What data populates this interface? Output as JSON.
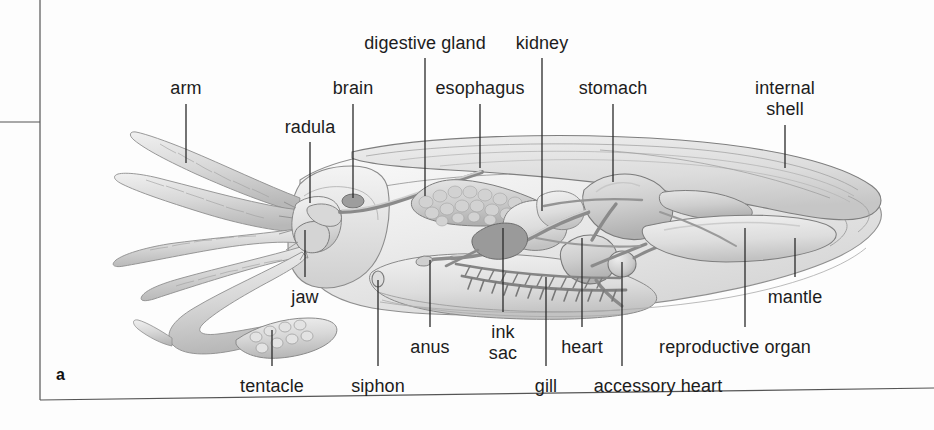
{
  "figure": {
    "panel_id": "a",
    "background_color": "#fdfdfd",
    "label_color": "#1c1c1c",
    "leader_color": "#2a2a2a"
  },
  "labels": [
    {
      "id": "arm",
      "text": "arm",
      "x": 186,
      "y": 78,
      "align": "center",
      "leader": {
        "x1": 186,
        "y1": 104,
        "x2": 186,
        "y2": 163
      }
    },
    {
      "id": "radula",
      "text": "radula",
      "x": 310,
      "y": 117,
      "align": "center",
      "leader": {
        "x1": 310,
        "y1": 142,
        "x2": 310,
        "y2": 203
      }
    },
    {
      "id": "brain",
      "text": "brain",
      "x": 353,
      "y": 78,
      "align": "center",
      "leader": {
        "x1": 353,
        "y1": 104,
        "x2": 353,
        "y2": 198
      }
    },
    {
      "id": "digestive-gland",
      "text": "digestive gland",
      "x": 425,
      "y": 33,
      "align": "center",
      "leader": {
        "x1": 425,
        "y1": 58,
        "x2": 425,
        "y2": 196
      }
    },
    {
      "id": "esophagus",
      "text": "esophagus",
      "x": 480,
      "y": 78,
      "align": "center",
      "leader": {
        "x1": 480,
        "y1": 104,
        "x2": 480,
        "y2": 168
      }
    },
    {
      "id": "kidney",
      "text": "kidney",
      "x": 542,
      "y": 33,
      "align": "center",
      "leader": {
        "x1": 542,
        "y1": 58,
        "x2": 542,
        "y2": 211
      }
    },
    {
      "id": "stomach",
      "text": "stomach",
      "x": 613,
      "y": 78,
      "align": "center",
      "leader": {
        "x1": 613,
        "y1": 104,
        "x2": 613,
        "y2": 182
      }
    },
    {
      "id": "internal-shell",
      "text": "internal\nshell",
      "x": 785,
      "y": 78,
      "align": "center",
      "leader": {
        "x1": 785,
        "y1": 125,
        "x2": 785,
        "y2": 168
      }
    },
    {
      "id": "jaw",
      "text": "jaw",
      "x": 305,
      "y": 287,
      "align": "center",
      "leader": {
        "x1": 305,
        "y1": 230,
        "x2": 305,
        "y2": 277
      }
    },
    {
      "id": "anus",
      "text": "anus",
      "x": 430,
      "y": 337,
      "align": "center",
      "leader": {
        "x1": 430,
        "y1": 260,
        "x2": 430,
        "y2": 327
      }
    },
    {
      "id": "ink-sac",
      "text": "ink\nsac",
      "x": 503,
      "y": 322,
      "align": "center",
      "leader": {
        "x1": 503,
        "y1": 228,
        "x2": 503,
        "y2": 312
      }
    },
    {
      "id": "gill",
      "text": "gill",
      "x": 546,
      "y": 376,
      "align": "center",
      "leader": {
        "x1": 546,
        "y1": 277,
        "x2": 546,
        "y2": 366
      }
    },
    {
      "id": "heart",
      "text": "heart",
      "x": 582,
      "y": 337,
      "align": "center",
      "leader": {
        "x1": 582,
        "y1": 238,
        "x2": 582,
        "y2": 327
      }
    },
    {
      "id": "accessory-heart",
      "text": "accessory heart",
      "x": 658,
      "y": 376,
      "align": "center",
      "leader": {
        "x1": 622,
        "y1": 262,
        "x2": 622,
        "y2": 366
      }
    },
    {
      "id": "reproductive-organ",
      "text": "reproductive organ",
      "x": 735,
      "y": 337,
      "align": "center",
      "leader": {
        "x1": 745,
        "y1": 228,
        "x2": 745,
        "y2": 327
      }
    },
    {
      "id": "mantle",
      "text": "mantle",
      "x": 795,
      "y": 287,
      "align": "center",
      "leader": {
        "x1": 795,
        "y1": 238,
        "x2": 795,
        "y2": 277
      }
    },
    {
      "id": "siphon",
      "text": "siphon",
      "x": 378,
      "y": 376,
      "align": "center",
      "leader": {
        "x1": 378,
        "y1": 280,
        "x2": 378,
        "y2": 366
      }
    },
    {
      "id": "tentacle",
      "text": "tentacle",
      "x": 272,
      "y": 376,
      "align": "center",
      "leader": {
        "x1": 272,
        "y1": 330,
        "x2": 272,
        "y2": 366
      }
    }
  ],
  "frame": {
    "vertical_x": 40,
    "vertical_y1": 0,
    "vertical_y2": 400,
    "tick_y": 122,
    "tick_x1": 0,
    "tick_x2": 40,
    "bottom_y_left": 400,
    "bottom_y_right": 388,
    "bottom_x2": 934
  }
}
